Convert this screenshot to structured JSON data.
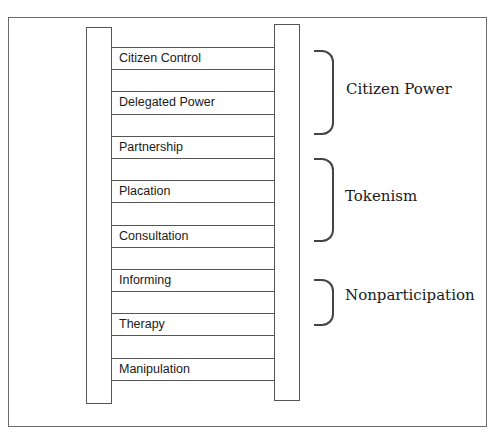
{
  "diagram": {
    "rungs": [
      {
        "label": "Citizen Control"
      },
      {
        "label": "Delegated Power"
      },
      {
        "label": "Partnership"
      },
      {
        "label": "Placation"
      },
      {
        "label": "Consultation"
      },
      {
        "label": "Informing"
      },
      {
        "label": "Therapy"
      },
      {
        "label": "Manipulation"
      }
    ],
    "groups": [
      {
        "label": "Citizen Power",
        "covers": [
          "Citizen Control",
          "Delegated Power",
          "Partnership"
        ]
      },
      {
        "label": "Tokenism",
        "covers": [
          "Placation",
          "Consultation",
          "Informing"
        ]
      },
      {
        "label": "Nonparticipation",
        "covers": [
          "Therapy",
          "Manipulation"
        ]
      }
    ]
  }
}
